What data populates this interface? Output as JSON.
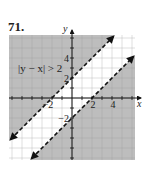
{
  "problem_number": "71.",
  "chart_data": {
    "type": "line",
    "title": "",
    "xlabel": "x",
    "ylabel": "y",
    "xlim": [
      -6.3,
      6.3
    ],
    "ylim": [
      -6.2,
      6.3
    ],
    "grid": true,
    "x_ticks": [
      -2,
      2,
      4
    ],
    "y_ticks": [
      -2,
      2,
      4
    ],
    "x_tick_labels": [
      "−2",
      "2",
      "4"
    ],
    "y_tick_labels": [
      "−2",
      "2",
      "4"
    ],
    "annotation": {
      "text": "|y − x| > 2",
      "x": -5.4,
      "y": 3.0
    },
    "series": [
      {
        "name": "y = x + 2",
        "slope": 1,
        "intercept": 2,
        "style": "dashed",
        "arrows": "both"
      },
      {
        "name": "y = x − 2",
        "slope": 1,
        "intercept": -2,
        "style": "dashed",
        "arrows": "both"
      }
    ],
    "shaded_region": {
      "inequality": "|y − x| > 2",
      "description": "outside the band between the two lines"
    },
    "colors": {
      "shade": "#bdbdbd",
      "grid": "#9a9a9a",
      "axis": "#111111",
      "line": "#111111",
      "band": "#ffffff"
    }
  }
}
